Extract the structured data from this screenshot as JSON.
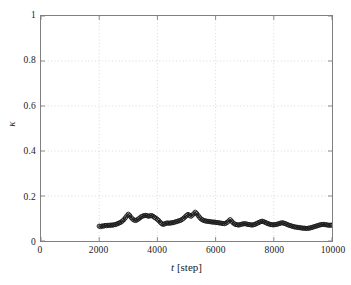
{
  "chart_data": {
    "type": "line",
    "title": "",
    "xlabel": "t [step]",
    "xlabel_var": "t",
    "xlabel_unit": "[step]",
    "ylabel": "κ",
    "xlim": [
      0,
      10000
    ],
    "ylim": [
      0,
      1
    ],
    "xticks": [
      0,
      2000,
      4000,
      6000,
      8000,
      10000
    ],
    "xticklabels": [
      "0",
      "2000",
      "4000",
      "6000",
      "8000",
      "10000"
    ],
    "yticks": [
      0,
      0.2,
      0.4,
      0.6,
      0.8,
      1
    ],
    "yticklabels": [
      "0",
      "0.2",
      "0.4",
      "0.6",
      "0.8",
      "1"
    ],
    "grid": true,
    "grid_style": "dotted",
    "grid_color": "#c8c8c8",
    "legend": null,
    "marker": "circle-open",
    "marker_color": "#1a1a1a",
    "line_color": "#1a1a1a",
    "series": [
      {
        "name": "kappa",
        "x": [
          2000,
          2050,
          2100,
          2150,
          2200,
          2250,
          2300,
          2350,
          2400,
          2450,
          2500,
          2550,
          2600,
          2650,
          2700,
          2750,
          2800,
          2850,
          2900,
          2950,
          3000,
          3050,
          3100,
          3150,
          3200,
          3250,
          3300,
          3350,
          3400,
          3450,
          3500,
          3550,
          3600,
          3650,
          3700,
          3750,
          3800,
          3850,
          3900,
          3950,
          4000,
          4050,
          4100,
          4150,
          4200,
          4250,
          4300,
          4350,
          4400,
          4450,
          4500,
          4550,
          4600,
          4650,
          4700,
          4750,
          4800,
          4850,
          4900,
          4950,
          5000,
          5050,
          5100,
          5150,
          5200,
          5250,
          5300,
          5350,
          5400,
          5450,
          5500,
          5550,
          5600,
          5650,
          5700,
          5750,
          5800,
          5850,
          5900,
          5950,
          6000,
          6050,
          6100,
          6150,
          6200,
          6250,
          6300,
          6350,
          6400,
          6450,
          6500,
          6550,
          6600,
          6650,
          6700,
          6750,
          6800,
          6850,
          6900,
          6950,
          7000,
          7050,
          7100,
          7150,
          7200,
          7250,
          7300,
          7350,
          7400,
          7450,
          7500,
          7550,
          7600,
          7650,
          7700,
          7750,
          7800,
          7850,
          7900,
          7950,
          8000,
          8050,
          8100,
          8150,
          8200,
          8250,
          8300,
          8350,
          8400,
          8450,
          8500,
          8550,
          8600,
          8650,
          8700,
          8750,
          8800,
          8850,
          8900,
          8950,
          9000,
          9050,
          9100,
          9150,
          9200,
          9250,
          9300,
          9350,
          9400,
          9450,
          9500,
          9550,
          9600,
          9650,
          9700,
          9750,
          9800,
          9850,
          9900,
          9950,
          10000
        ],
        "y": [
          0.066,
          0.064,
          0.067,
          0.066,
          0.069,
          0.068,
          0.07,
          0.069,
          0.071,
          0.07,
          0.072,
          0.073,
          0.075,
          0.078,
          0.081,
          0.084,
          0.089,
          0.095,
          0.103,
          0.112,
          0.119,
          0.113,
          0.104,
          0.097,
          0.093,
          0.091,
          0.094,
          0.098,
          0.103,
          0.108,
          0.111,
          0.113,
          0.114,
          0.112,
          0.11,
          0.112,
          0.113,
          0.11,
          0.105,
          0.101,
          0.096,
          0.09,
          0.083,
          0.077,
          0.074,
          0.076,
          0.079,
          0.08,
          0.079,
          0.08,
          0.081,
          0.082,
          0.084,
          0.086,
          0.088,
          0.09,
          0.092,
          0.096,
          0.101,
          0.107,
          0.113,
          0.118,
          0.114,
          0.11,
          0.115,
          0.121,
          0.128,
          0.122,
          0.113,
          0.105,
          0.098,
          0.094,
          0.091,
          0.089,
          0.088,
          0.087,
          0.086,
          0.085,
          0.084,
          0.084,
          0.083,
          0.082,
          0.081,
          0.08,
          0.079,
          0.078,
          0.077,
          0.079,
          0.083,
          0.089,
          0.095,
          0.088,
          0.081,
          0.076,
          0.073,
          0.072,
          0.071,
          0.073,
          0.075,
          0.076,
          0.077,
          0.076,
          0.074,
          0.073,
          0.072,
          0.071,
          0.072,
          0.074,
          0.077,
          0.08,
          0.083,
          0.086,
          0.088,
          0.086,
          0.083,
          0.08,
          0.077,
          0.075,
          0.073,
          0.072,
          0.072,
          0.073,
          0.074,
          0.076,
          0.078,
          0.08,
          0.081,
          0.079,
          0.077,
          0.074,
          0.071,
          0.069,
          0.067,
          0.065,
          0.063,
          0.062,
          0.061,
          0.06,
          0.059,
          0.058,
          0.057,
          0.057,
          0.056,
          0.056,
          0.057,
          0.058,
          0.06,
          0.062,
          0.064,
          0.066,
          0.068,
          0.07,
          0.072,
          0.073,
          0.074,
          0.073,
          0.072,
          0.071,
          0.07,
          0.07,
          0.071
        ]
      }
    ]
  }
}
